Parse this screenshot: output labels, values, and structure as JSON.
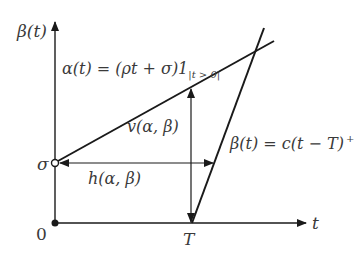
{
  "diagram": {
    "type": "service-curve-deviation",
    "axes": {
      "x_label": "t",
      "y_label": "β(t)",
      "origin_label": "0"
    },
    "points": {
      "sigma_label": "σ",
      "T_label": "T"
    },
    "curves": {
      "alpha": {
        "label_main": "α(t) = (ρt + σ)1",
        "label_sub": "|t > 0|"
      },
      "beta": {
        "label_main": "β(t) = c(t − T)",
        "label_sup": "+"
      }
    },
    "measures": {
      "vertical": "v(α, β)",
      "horizontal": "h(α, β)"
    },
    "colors": {
      "line": "#1a1a1a",
      "text": "#3a3a3a",
      "background": "#ffffff"
    }
  }
}
